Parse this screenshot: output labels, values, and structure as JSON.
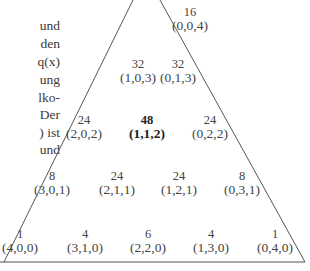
{
  "left_text_fragments": [
    {
      "text": "und",
      "top": 18
    },
    {
      "text": "den",
      "top": 36
    },
    {
      "text": "q(x)",
      "top": 54
    },
    {
      "text": "ung",
      "top": 72
    },
    {
      "text": "lko-",
      "top": 90
    },
    {
      "text": "Der",
      "top": 107
    },
    {
      "text": ") ist",
      "top": 125
    },
    {
      "text": "und",
      "top": 142
    }
  ],
  "triangle": {
    "nodes": [
      {
        "weight": "16",
        "coord": "(0,0,4)",
        "x": 190,
        "y": 5,
        "bold": false
      },
      {
        "weight": "32",
        "coord": "(1,0,3)",
        "x": 138,
        "y": 57,
        "bold": false
      },
      {
        "weight": "32",
        "coord": "(0,1,3)",
        "x": 178,
        "y": 57,
        "bold": false
      },
      {
        "weight": "24",
        "coord": "(2,0,2)",
        "x": 84,
        "y": 113,
        "bold": false
      },
      {
        "weight": "48",
        "coord": "(1,1,2)",
        "x": 147,
        "y": 113,
        "bold": true
      },
      {
        "weight": "24",
        "coord": "(0,2,2)",
        "x": 210,
        "y": 113,
        "bold": false
      },
      {
        "weight": "8",
        "coord": "(3,0,1)",
        "x": 52,
        "y": 169,
        "bold": false
      },
      {
        "weight": "24",
        "coord": "(2,1,1)",
        "x": 117,
        "y": 169,
        "bold": false
      },
      {
        "weight": "24",
        "coord": "(1,2,1)",
        "x": 179,
        "y": 169,
        "bold": false
      },
      {
        "weight": "8",
        "coord": "(0,3,1)",
        "x": 242,
        "y": 169,
        "bold": false
      },
      {
        "weight": "1",
        "coord": "(4,0,0)",
        "x": 20,
        "y": 227,
        "bold": false
      },
      {
        "weight": "4",
        "coord": "(3,1,0)",
        "x": 85,
        "y": 227,
        "bold": false
      },
      {
        "weight": "6",
        "coord": "(2,2,0)",
        "x": 148,
        "y": 227,
        "bold": false
      },
      {
        "weight": "4",
        "coord": "(1,3,0)",
        "x": 211,
        "y": 227,
        "bold": false
      },
      {
        "weight": "1",
        "coord": "(0,4,0)",
        "x": 275,
        "y": 227,
        "bold": false
      }
    ]
  }
}
